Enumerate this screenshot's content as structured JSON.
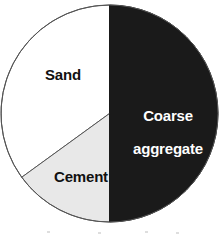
{
  "chart_data": {
    "type": "pie",
    "title": "",
    "subtitle": "",
    "xlabel": "",
    "ylabel": "",
    "legend_position": "none",
    "labels_inside_slices": true,
    "categories": [
      "Coarse aggregate",
      "Sand",
      "Cement"
    ],
    "values": [
      50,
      35,
      15
    ],
    "unit": "percent",
    "slices": [
      {
        "label": "Coarse aggregate",
        "label_line1": "Coarse",
        "label_line2": "aggregate",
        "value": 50,
        "start_angle_deg": 0,
        "end_angle_deg": 180,
        "fill": "#1a1a1a",
        "text_color": "#ffffff"
      },
      {
        "label": "Sand",
        "label_line1": "Sand",
        "label_line2": "",
        "value": 35,
        "start_angle_deg": 234,
        "end_angle_deg": 360,
        "fill": "#ffffff",
        "text_color": "#111111"
      },
      {
        "label": "Cement",
        "label_line1": "Cement",
        "label_line2": "",
        "value": 15,
        "start_angle_deg": 180,
        "end_angle_deg": 234,
        "fill": "#e8e8e8",
        "text_color": "#111111"
      }
    ],
    "geometry": {
      "center_x": 109.5,
      "center_y": 113.5,
      "radius": 108.5
    },
    "colors": {
      "background": "#ffffff",
      "outline": "#555555",
      "coarse_aggregate": "#1a1a1a",
      "sand": "#ffffff",
      "cement": "#e8e8e8"
    }
  }
}
